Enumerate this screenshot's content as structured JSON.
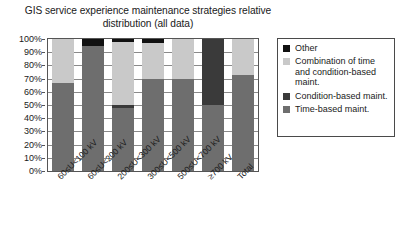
{
  "chart_data": {
    "type": "bar",
    "stacked": true,
    "title": "GIS service experience maintenance strategies relative distribution (all data)",
    "title_lines": [
      "GIS service experience maintenance strategies relative",
      "distribution (all data)"
    ],
    "xlabel": "",
    "ylabel": "",
    "ylim": [
      0,
      100
    ],
    "ytick_step": 10,
    "grid": true,
    "legend_position": "right",
    "categories": [
      "60≤U<100 kV",
      "60≤U<200 kV",
      "200≤U<300 kV",
      "300≤U<500 kV",
      "500≤U<700 kV",
      "≥700 kV",
      "Total"
    ],
    "ytick_labels": [
      "0%",
      "10%",
      "20%",
      "30%",
      "40%",
      "50%",
      "60%",
      "70%",
      "80%",
      "90%",
      "100%"
    ],
    "ytick_values": [
      0,
      10,
      20,
      30,
      40,
      50,
      60,
      70,
      80,
      90,
      100
    ],
    "series": [
      {
        "name": "Time-based maint.",
        "color": "#6e6e6e",
        "values": [
          67,
          95,
          48,
          70,
          70,
          50,
          73
        ]
      },
      {
        "name": "Condition-based maint.",
        "color": "#3a3a3a",
        "values": [
          0,
          0,
          2,
          0,
          0,
          50,
          0
        ]
      },
      {
        "name": "Combination of time and condition-based maint.",
        "color": "#c9c9c9",
        "values": [
          33,
          0,
          48,
          27,
          30,
          0,
          27
        ]
      },
      {
        "name": "Other",
        "color": "#111111",
        "values": [
          0,
          5,
          2,
          3,
          0,
          0,
          0
        ]
      }
    ]
  },
  "legend": {
    "items": [
      {
        "label": "Other",
        "color": "#111111"
      },
      {
        "label": "Combination of time and condition-based maint.",
        "color": "#c9c9c9"
      },
      {
        "label": "Condition-based maint.",
        "color": "#3a3a3a"
      },
      {
        "label": "Time-based maint.",
        "color": "#6e6e6e"
      }
    ]
  }
}
